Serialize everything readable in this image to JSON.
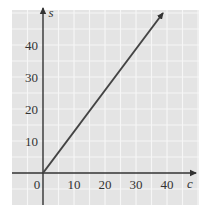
{
  "chart_data": {
    "type": "line",
    "title": "",
    "xlabel": "c",
    "ylabel": "s",
    "xlim": [
      -10,
      50
    ],
    "ylim": [
      -10,
      50
    ],
    "x_ticks": [
      0,
      10,
      20,
      30,
      40
    ],
    "y_ticks": [
      10,
      20,
      30,
      40
    ],
    "x_tick_labels": [
      "0",
      "10",
      "20",
      "30",
      "40"
    ],
    "y_tick_labels": [
      "10",
      "20",
      "30",
      "40"
    ],
    "grid": true,
    "grid_step": 5,
    "legend": null,
    "series": [
      {
        "name": "s = 1.3c",
        "x": [
          0,
          38.7
        ],
        "y": [
          0,
          50
        ],
        "arrow_end": true
      }
    ]
  },
  "colors": {
    "grid_background": "#e4e4e4",
    "grid_lines": "#f6f6f6",
    "axis": "#333333",
    "series_line": "#444444"
  }
}
